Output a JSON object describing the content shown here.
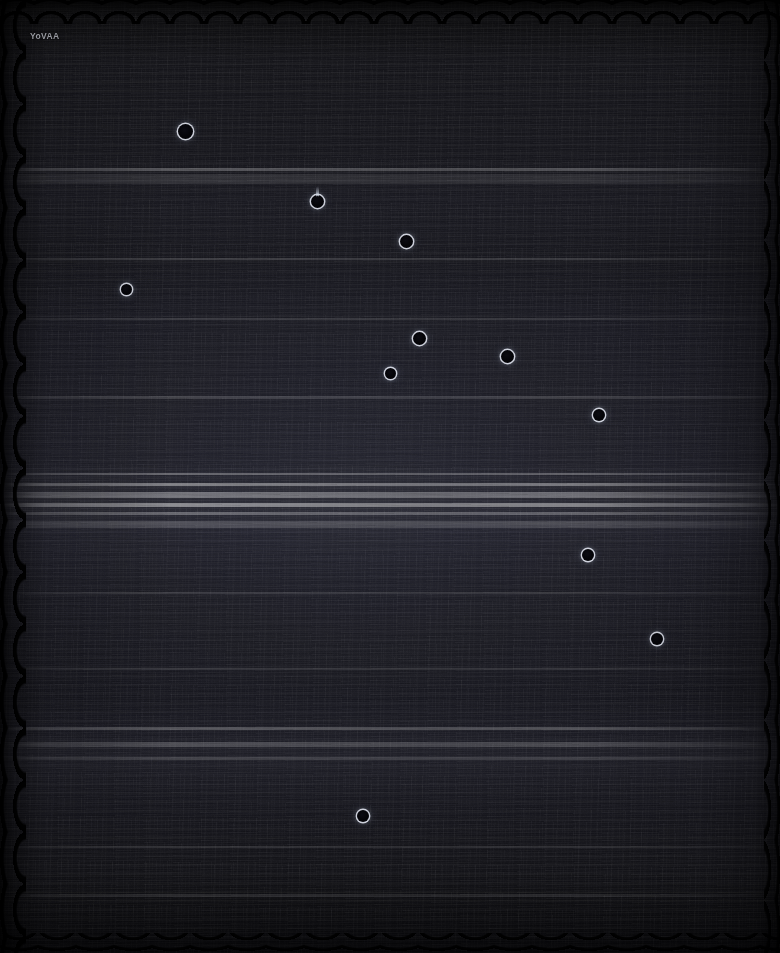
{
  "plate": {
    "width": 780,
    "height": 953,
    "background_color": "#0a0a0b",
    "base_tone_color": "#17171d",
    "brightest_band_color": "#26262f",
    "rim_color": "#e2e6f0",
    "core_color": "#05050a"
  },
  "watermark": {
    "text": "YoVAA",
    "x": 30,
    "y": 31,
    "color": "#96989f"
  },
  "objects": [
    {
      "id": 1,
      "label": "ring-object-1",
      "x": 185,
      "y": 131,
      "d": 15,
      "tail": false,
      "tail_h": 0
    },
    {
      "id": 2,
      "label": "ring-object-2",
      "x": 317,
      "y": 201,
      "d": 13,
      "tail": true,
      "tail_h": 11
    },
    {
      "id": 3,
      "label": "ring-object-3",
      "x": 406,
      "y": 241,
      "d": 13,
      "tail": false,
      "tail_h": 0
    },
    {
      "id": 4,
      "label": "ring-object-4",
      "x": 126,
      "y": 289,
      "d": 11,
      "tail": false,
      "tail_h": 0
    },
    {
      "id": 5,
      "label": "ring-object-5",
      "x": 419,
      "y": 338,
      "d": 13,
      "tail": false,
      "tail_h": 0
    },
    {
      "id": 6,
      "label": "ring-object-6",
      "x": 507,
      "y": 356,
      "d": 13,
      "tail": false,
      "tail_h": 0
    },
    {
      "id": 7,
      "label": "ring-object-7",
      "x": 390,
      "y": 373,
      "d": 11,
      "tail": false,
      "tail_h": 0
    },
    {
      "id": 8,
      "label": "ring-object-8",
      "x": 599,
      "y": 415,
      "d": 12,
      "tail": false,
      "tail_h": 0
    },
    {
      "id": 9,
      "label": "ring-object-9",
      "x": 588,
      "y": 555,
      "d": 12,
      "tail": false,
      "tail_h": 0
    },
    {
      "id": 10,
      "label": "ring-object-10",
      "x": 657,
      "y": 639,
      "d": 12,
      "tail": false,
      "tail_h": 0
    },
    {
      "id": 11,
      "label": "ring-object-11",
      "x": 363,
      "y": 816,
      "d": 12,
      "tail": false,
      "tail_h": 0
    }
  ],
  "bands": [
    {
      "label": "band-upper-faint",
      "y": 168,
      "h": 3,
      "opacity": 0.26
    },
    {
      "label": "band-upper-wide",
      "y": 174,
      "h": 10,
      "opacity": 0.1
    },
    {
      "label": "band-mid-a",
      "y": 258,
      "h": 2,
      "opacity": 0.16
    },
    {
      "label": "band-mid-b",
      "y": 318,
      "h": 2,
      "opacity": 0.13
    },
    {
      "label": "band-mid-c",
      "y": 396,
      "h": 3,
      "opacity": 0.14
    },
    {
      "label": "band-core-a",
      "y": 473,
      "h": 2,
      "opacity": 0.3
    },
    {
      "label": "band-core-b",
      "y": 483,
      "h": 3,
      "opacity": 0.4
    },
    {
      "label": "band-core-c",
      "y": 492,
      "h": 6,
      "opacity": 0.34
    },
    {
      "label": "band-core-d",
      "y": 503,
      "h": 4,
      "opacity": 0.44
    },
    {
      "label": "band-core-e",
      "y": 512,
      "h": 3,
      "opacity": 0.28
    },
    {
      "label": "band-core-f",
      "y": 521,
      "h": 7,
      "opacity": 0.18
    },
    {
      "label": "band-lower-a",
      "y": 592,
      "h": 2,
      "opacity": 0.12
    },
    {
      "label": "band-lower-b",
      "y": 668,
      "h": 2,
      "opacity": 0.11
    },
    {
      "label": "band-lower-c",
      "y": 727,
      "h": 3,
      "opacity": 0.24
    },
    {
      "label": "band-lower-d",
      "y": 742,
      "h": 5,
      "opacity": 0.2
    },
    {
      "label": "band-lower-e",
      "y": 757,
      "h": 3,
      "opacity": 0.15
    },
    {
      "label": "band-lower-f",
      "y": 846,
      "h": 2,
      "opacity": 0.1
    },
    {
      "label": "band-lower-g",
      "y": 894,
      "h": 3,
      "opacity": 0.12
    }
  ]
}
